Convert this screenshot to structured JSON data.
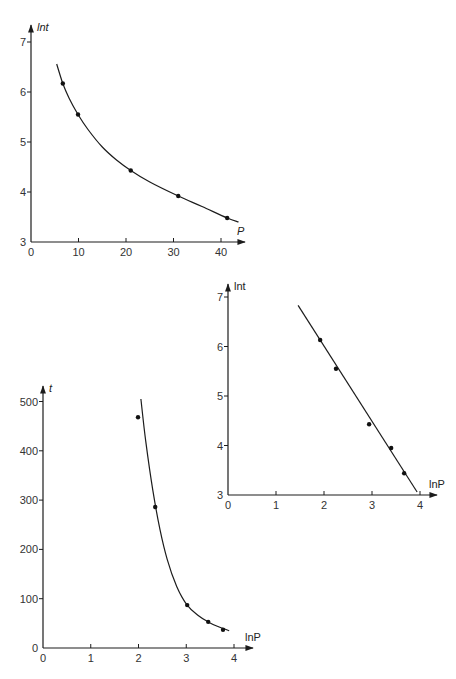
{
  "page": {
    "header_left": "",
    "header_center": "",
    "header_right": ""
  },
  "chart_data": [
    {
      "id": "top",
      "type": "scatter",
      "title": "",
      "xlabel": "P",
      "ylabel": "lnt",
      "xlim": [
        0,
        44
      ],
      "ylim": [
        3,
        7.3
      ],
      "xticks": [
        0,
        10,
        20,
        30,
        40
      ],
      "yticks": [
        3,
        4,
        5,
        6,
        7
      ],
      "grid": false,
      "legend": null,
      "points": {
        "x": [
          6.7,
          9.9,
          21,
          31,
          41.3
        ],
        "y": [
          6.17,
          5.55,
          4.43,
          3.92,
          3.48
        ]
      },
      "fit_curve": {
        "type": "smooth",
        "x": [
          5.4,
          6.7,
          8,
          9.9,
          12,
          15,
          18,
          21,
          25,
          31,
          36,
          41.3,
          43.7
        ],
        "y": [
          6.56,
          6.17,
          5.88,
          5.55,
          5.25,
          4.9,
          4.64,
          4.43,
          4.2,
          3.92,
          3.71,
          3.48,
          3.4
        ]
      },
      "px": {
        "ox": 31,
        "oy": 242,
        "sx": 4.75,
        "sy": 50,
        "x_end": 245,
        "y_end": 25
      }
    },
    {
      "id": "right",
      "type": "scatter",
      "title": "",
      "xlabel": "lnP",
      "ylabel": "lnt",
      "xlim": [
        0,
        4.3
      ],
      "ylim": [
        3,
        7.1
      ],
      "xticks": [
        0,
        1,
        2,
        3,
        4
      ],
      "yticks": [
        3,
        4,
        5,
        6,
        7
      ],
      "grid": false,
      "legend": null,
      "points": {
        "x": [
          1.92,
          2.25,
          2.94,
          3.4,
          3.67
        ],
        "y": [
          6.13,
          5.55,
          4.43,
          3.95,
          3.44
        ]
      },
      "fit_curve": {
        "type": "line",
        "x": [
          1.46,
          3.94
        ],
        "y": [
          6.83,
          3.06
        ]
      },
      "px": {
        "ox": 228,
        "oy": 495,
        "sx": 48,
        "sy": 49.5,
        "x_end": 437,
        "y_end": 284
      }
    },
    {
      "id": "bottom",
      "type": "scatter",
      "title": "",
      "xlabel": "lnP",
      "ylabel": "t",
      "xlim": [
        0,
        4.3
      ],
      "ylim": [
        0,
        530
      ],
      "xticks": [
        0,
        1,
        2,
        3,
        4
      ],
      "yticks": [
        0,
        100,
        200,
        300,
        400,
        500
      ],
      "grid": false,
      "legend": null,
      "points": {
        "x": [
          1.99,
          2.35,
          3.02,
          3.46,
          3.77
        ],
        "y": [
          468,
          286,
          87,
          53,
          37
        ]
      },
      "fit_curve": {
        "type": "smooth",
        "x": [
          2.05,
          2.15,
          2.3,
          2.45,
          2.6,
          2.8,
          3.02,
          3.25,
          3.46,
          3.65,
          3.9
        ],
        "y": [
          505,
          420,
          320,
          240,
          180,
          125,
          87,
          66,
          53,
          44,
          35
        ]
      },
      "px": {
        "ox": 43,
        "oy": 648,
        "sx": 47.75,
        "sy": 0.493,
        "x_end": 253,
        "y_end": 386
      }
    }
  ]
}
